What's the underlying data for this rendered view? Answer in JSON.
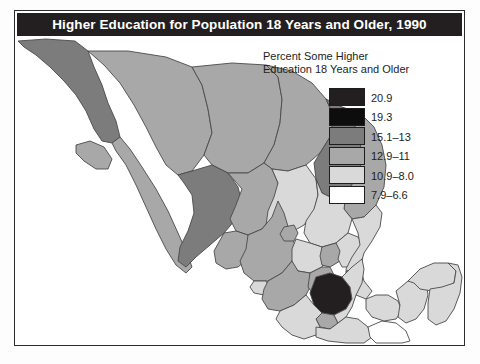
{
  "figure": {
    "title": "Higher Education for Population 18 Years and Older, 1990",
    "title_bar_color": "#231f20",
    "frame_color": "#2b2b2b",
    "background_color": "#ffffff"
  },
  "legend": {
    "title": "Percent Some Higher\nEducation 18 Years and Older",
    "title_line1": "Percent Some Higher",
    "title_line2": "Education 18 Years and Older",
    "items": [
      {
        "label": "20.9",
        "color": "#231f20"
      },
      {
        "label": "19.3",
        "color": "#0d0d0d"
      },
      {
        "label": "15.1–13",
        "color": "#7c7c7c"
      },
      {
        "label": "12.9–11",
        "color": "#a8a8a8"
      },
      {
        "label": "10.9–8.0",
        "color": "#d9d9d9"
      },
      {
        "label": "7.9–6.6",
        "color": "#ffffff"
      }
    ]
  },
  "map": {
    "name": "mexico-choropleth",
    "region_label": "Mexico states shaded by percent with some higher education",
    "outline_color": "#4a4a4a",
    "regions": [
      {
        "name": "baja-california-norte",
        "class": "c3"
      },
      {
        "name": "baja-california-sur",
        "class": "c4"
      },
      {
        "name": "sonora",
        "class": "c4"
      },
      {
        "name": "chihuahua",
        "class": "c4"
      },
      {
        "name": "coahuila",
        "class": "c4"
      },
      {
        "name": "nuevo-leon",
        "class": "c3"
      },
      {
        "name": "tamaulipas",
        "class": "c4"
      },
      {
        "name": "sinaloa",
        "class": "c3"
      },
      {
        "name": "durango",
        "class": "c4"
      },
      {
        "name": "zacatecas",
        "class": "c5"
      },
      {
        "name": "san-luis-potosi",
        "class": "c5"
      },
      {
        "name": "nayarit",
        "class": "c4"
      },
      {
        "name": "jalisco",
        "class": "c4"
      },
      {
        "name": "aguascalientes",
        "class": "c4"
      },
      {
        "name": "guanajuato",
        "class": "c5"
      },
      {
        "name": "queretaro",
        "class": "c4"
      },
      {
        "name": "hidalgo",
        "class": "c5"
      },
      {
        "name": "veracruz",
        "class": "c5"
      },
      {
        "name": "colima",
        "class": "c5"
      },
      {
        "name": "michoacan",
        "class": "c4"
      },
      {
        "name": "mexico-state",
        "class": "c4"
      },
      {
        "name": "distrito-federal",
        "class": "c1"
      },
      {
        "name": "morelos",
        "class": "c4"
      },
      {
        "name": "tlaxcala",
        "class": "c4"
      },
      {
        "name": "puebla",
        "class": "c5"
      },
      {
        "name": "guerrero",
        "class": "c5"
      },
      {
        "name": "oaxaca",
        "class": "c5"
      },
      {
        "name": "chiapas",
        "class": "c6"
      },
      {
        "name": "tabasco",
        "class": "c5"
      },
      {
        "name": "campeche",
        "class": "c5"
      },
      {
        "name": "yucatan",
        "class": "c5"
      },
      {
        "name": "quintana-roo",
        "class": "c5"
      }
    ]
  }
}
